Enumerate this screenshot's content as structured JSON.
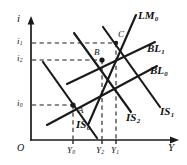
{
  "figure": {
    "kind": "is-lm-bp-diagram",
    "axes": {
      "y_axis_name": "i",
      "x_axis_name": "Y",
      "origin_label": "O"
    },
    "y_ticks": [
      {
        "id": "i1",
        "base": "i",
        "sub": "1",
        "value_px": 43
      },
      {
        "id": "i2",
        "base": "i",
        "sub": "2",
        "value_px": 60
      },
      {
        "id": "i0",
        "base": "i",
        "sub": "0",
        "value_px": 105
      }
    ],
    "x_ticks": [
      {
        "id": "Y0",
        "base": "Y",
        "sub": "0",
        "value_px": 73
      },
      {
        "id": "Y2",
        "base": "Y",
        "sub": "2",
        "value_px": 102
      },
      {
        "id": "Y1",
        "base": "Y",
        "sub": "1",
        "value_px": 116
      }
    ],
    "curves": [
      {
        "id": "LM0",
        "base": "LM",
        "sub": "0"
      },
      {
        "id": "BL1",
        "base": "BL",
        "sub": "1"
      },
      {
        "id": "BL0",
        "base": "BL",
        "sub": "0"
      },
      {
        "id": "IS1",
        "base": "IS",
        "sub": "1"
      },
      {
        "id": "IS2",
        "base": "IS",
        "sub": "2"
      },
      {
        "id": "IS0",
        "base": "IS",
        "sub": "0"
      }
    ],
    "points": [
      {
        "id": "A",
        "label": "A"
      },
      {
        "id": "B",
        "label": "B"
      },
      {
        "id": "C",
        "label": "C"
      }
    ]
  }
}
